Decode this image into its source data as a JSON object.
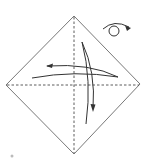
{
  "diagram": {
    "type": "origami-fold-step",
    "colors": {
      "line": "#555555",
      "background": "#ffffff"
    },
    "elements": {
      "paper": "square-diamond",
      "creases": [
        "vertical-valley-fold",
        "horizontal-valley-fold"
      ],
      "arrows": [
        "fold-arrow-horizontal-left",
        "fold-arrow-vertical-down"
      ],
      "symbol": "turn-over-icon"
    }
  }
}
